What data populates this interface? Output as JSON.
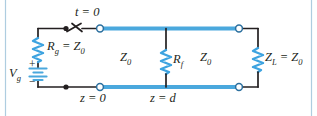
{
  "figure": {
    "type": "circuit-diagram",
    "border_color": "#aecde0",
    "background": "#ffffff",
    "line_color": "#231f20",
    "transmission_line_color": "#4aa8dd",
    "resistor_color": "#3da3e0",
    "terminal_fill": "#ffffff"
  },
  "labels": {
    "switch_time": {
      "var": "t",
      "eq": " = 0",
      "text": "t = 0"
    },
    "source_resistor": {
      "var": "R",
      "sub": "g",
      "eq": " = Z",
      "eq_sub": "0",
      "text": "Rg = Z0"
    },
    "source": {
      "var": "V",
      "sub": "g",
      "text": "Vg"
    },
    "plus_sign": "+",
    "minus_sign": "−",
    "line_impedance_left": {
      "var": "Z",
      "sub": "0",
      "text": "Z0"
    },
    "line_impedance_right": {
      "var": "Z",
      "sub": "0",
      "text": "Z0"
    },
    "fault_resistor": {
      "var": "R",
      "sub": "f",
      "text": "Rf"
    },
    "load_impedance": {
      "var": "Z",
      "sub": "L",
      "eq": " = Z",
      "eq_sub": "0",
      "text": "ZL = Z0"
    },
    "position_source_end": {
      "var": "z",
      "eq": " = 0",
      "text": "z = 0"
    },
    "position_fault": {
      "var": "z",
      "eq": " = d",
      "text": "z = d"
    }
  },
  "components": [
    {
      "name": "source-resistor",
      "label": "Rg = Z0"
    },
    {
      "name": "voltage-source",
      "label": "Vg"
    },
    {
      "name": "switch",
      "label": "t = 0"
    },
    {
      "name": "fault-resistor",
      "label": "Rf"
    },
    {
      "name": "load-resistor",
      "label": "ZL = Z0"
    }
  ]
}
